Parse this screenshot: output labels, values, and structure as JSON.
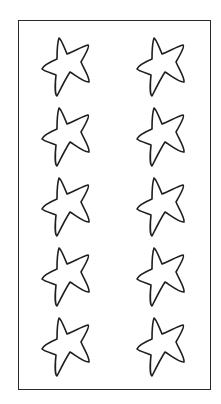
{
  "sheet": {
    "title": "Star outlines",
    "border_color": "#2a2a2a",
    "stroke_color": "#1e1e1e",
    "background": "#ffffff",
    "layout": {
      "rows": 5,
      "columns": 2
    },
    "stars": [
      {
        "row": 1,
        "col": 1,
        "icon": "star-outline-icon"
      },
      {
        "row": 1,
        "col": 2,
        "icon": "star-outline-icon"
      },
      {
        "row": 2,
        "col": 1,
        "icon": "star-outline-icon"
      },
      {
        "row": 2,
        "col": 2,
        "icon": "star-outline-icon"
      },
      {
        "row": 3,
        "col": 1,
        "icon": "star-outline-icon"
      },
      {
        "row": 3,
        "col": 2,
        "icon": "star-outline-icon"
      },
      {
        "row": 4,
        "col": 1,
        "icon": "star-outline-icon"
      },
      {
        "row": 4,
        "col": 2,
        "icon": "star-outline-icon"
      },
      {
        "row": 5,
        "col": 1,
        "icon": "star-outline-icon"
      },
      {
        "row": 5,
        "col": 2,
        "icon": "star-outline-icon"
      }
    ]
  }
}
